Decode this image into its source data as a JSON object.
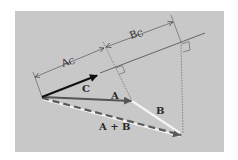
{
  "figure": {
    "background": "#ffffff",
    "panel_color": "#c8c8c8",
    "line_color": "#4a4a4a",
    "vector_color": "#1a1a1a",
    "vector_a_color": "#555555",
    "highlight_color": "#f4f4f4"
  },
  "labels": {
    "vector_c": "C",
    "vector_a": "A",
    "vector_b": "B",
    "vector_sum": "A + B",
    "projection_a": "A",
    "projection_a_sub": "C",
    "projection_b": "B",
    "projection_b_sub": "C"
  },
  "geometry": {
    "origin": [
      42,
      97
    ],
    "tip_c": [
      98,
      75
    ],
    "tip_a": [
      132,
      101
    ],
    "tip_sum": [
      183,
      135
    ]
  }
}
